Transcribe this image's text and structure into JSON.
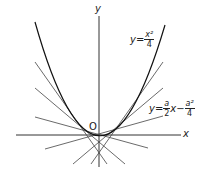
{
  "diagram": {
    "axes": {
      "x_label": "x",
      "y_label": "y",
      "origin_label": "O"
    },
    "curve_label": {
      "lhs": "y",
      "eq": "=",
      "num": "x²",
      "den": "4"
    },
    "tangent_label": {
      "lhs": "y",
      "eq": "=",
      "num1": "a",
      "den1": "2",
      "var": "x",
      "minus": "−",
      "num2": "a²",
      "den2": "4"
    },
    "colors": {
      "line": "#333333",
      "curve": "#111111"
    }
  }
}
